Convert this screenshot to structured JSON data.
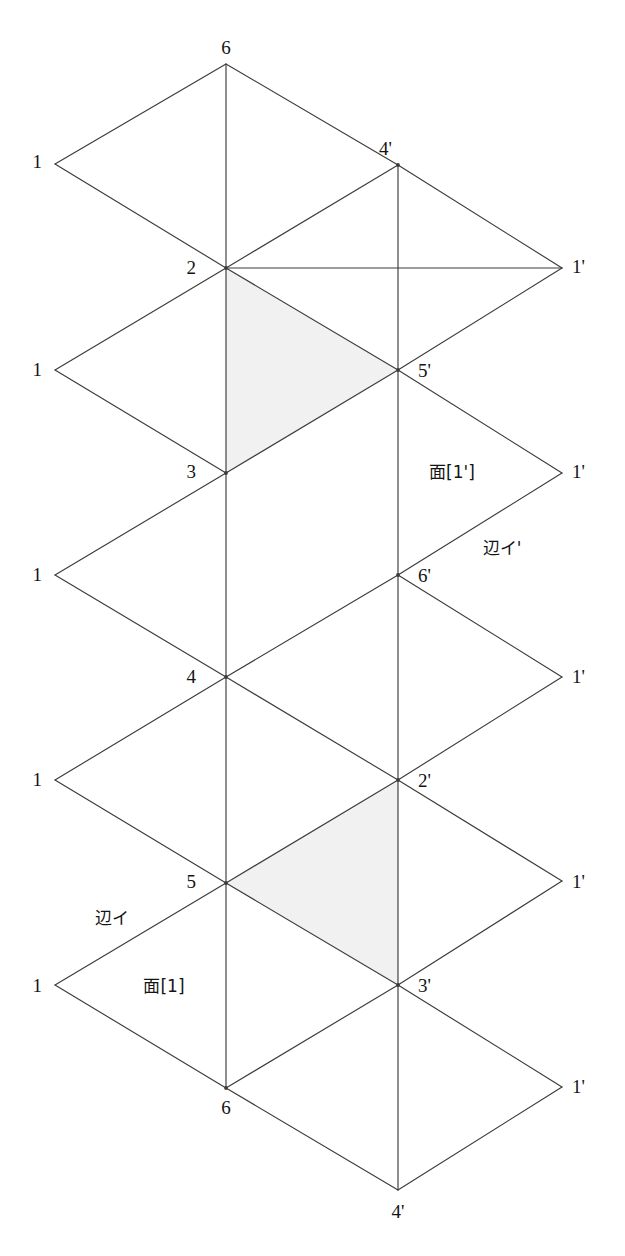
{
  "diagram": {
    "background_color": "#ffffff",
    "line_color": "#3c3c3c",
    "shade_color": "#f1f1f1",
    "vertex_labels": [
      {
        "id": "v-6-top",
        "text": "6",
        "x": 226,
        "y": 47,
        "anchor": "c"
      },
      {
        "id": "v-1-a",
        "text": "1",
        "x": 42,
        "y": 161,
        "anchor": "r"
      },
      {
        "id": "v-4p-top",
        "text": "4'",
        "x": 392,
        "y": 148,
        "anchor": "r"
      },
      {
        "id": "v-2",
        "text": "2",
        "x": 196,
        "y": 267,
        "anchor": "r"
      },
      {
        "id": "v-1p-a",
        "text": "1'",
        "x": 572,
        "y": 266,
        "anchor": "l"
      },
      {
        "id": "v-1-b",
        "text": "1",
        "x": 42,
        "y": 369,
        "anchor": "r"
      },
      {
        "id": "v-5p",
        "text": "5'",
        "x": 418,
        "y": 370,
        "anchor": "l"
      },
      {
        "id": "v-3",
        "text": "3",
        "x": 196,
        "y": 471,
        "anchor": "r"
      },
      {
        "id": "v-1p-b",
        "text": "1'",
        "x": 572,
        "y": 471,
        "anchor": "l"
      },
      {
        "id": "v-1-c",
        "text": "1",
        "x": 42,
        "y": 574,
        "anchor": "r"
      },
      {
        "id": "v-6p",
        "text": "6'",
        "x": 418,
        "y": 575,
        "anchor": "l"
      },
      {
        "id": "v-4",
        "text": "4",
        "x": 196,
        "y": 676,
        "anchor": "r"
      },
      {
        "id": "v-1p-c",
        "text": "1'",
        "x": 572,
        "y": 676,
        "anchor": "l"
      },
      {
        "id": "v-1-d",
        "text": "1",
        "x": 42,
        "y": 779,
        "anchor": "r"
      },
      {
        "id": "v-2p",
        "text": "2'",
        "x": 418,
        "y": 780,
        "anchor": "l"
      },
      {
        "id": "v-5",
        "text": "5",
        "x": 196,
        "y": 881,
        "anchor": "r"
      },
      {
        "id": "v-1p-d",
        "text": "1'",
        "x": 572,
        "y": 881,
        "anchor": "l"
      },
      {
        "id": "v-1-e",
        "text": "1",
        "x": 42,
        "y": 985,
        "anchor": "r"
      },
      {
        "id": "v-3p",
        "text": "3'",
        "x": 418,
        "y": 985,
        "anchor": "l"
      },
      {
        "id": "v-6-bottom",
        "text": "6",
        "x": 226,
        "y": 1107,
        "anchor": "c"
      },
      {
        "id": "v-1p-e",
        "text": "1'",
        "x": 572,
        "y": 1086,
        "anchor": "l"
      },
      {
        "id": "v-4p-bot",
        "text": "4'",
        "x": 398,
        "y": 1211,
        "anchor": "c"
      }
    ],
    "annotation_labels": [
      {
        "id": "face-1-prime",
        "text": "面[1']",
        "x": 452,
        "y": 472
      },
      {
        "id": "edge-i-prime",
        "text": "辺イ'",
        "x": 502,
        "y": 548
      },
      {
        "id": "edge-i",
        "text": "辺イ",
        "x": 112,
        "y": 918
      },
      {
        "id": "face-1",
        "text": "面[1]",
        "x": 164,
        "y": 986
      }
    ],
    "geometry": {
      "columns_x": [
        55,
        226,
        398,
        562
      ],
      "row_pitch_y": 102.4,
      "top_vertex_y": 64,
      "bottom_vertex_y": 1190
    },
    "shaded_regions": [
      {
        "id": "shade-upper",
        "points": "226,268 398,370 226,473"
      },
      {
        "id": "shade-lower",
        "points": "226,883 398,780 398,985"
      }
    ],
    "edges": [
      "55,164 226,64",
      "226,64 398,165",
      "398,165 562,268",
      "55,164 226,268",
      "226,268 398,165",
      "226,268 562,268",
      "226,64 226,268",
      "398,165 398,370",
      "55,370 226,268",
      "226,268 398,370",
      "398,370 562,268",
      "55,370 226,473",
      "226,473 398,370",
      "398,370 562,473",
      "226,268 226,473",
      "55,575 226,473",
      "226,473 398,370",
      "398,370 398,575",
      "55,575 226,677",
      "226,677 398,575",
      "398,575 562,473",
      "398,575 562,677",
      "226,473 226,677",
      "55,780 226,677",
      "226,677 398,780",
      "398,780 562,677",
      "398,575 398,780",
      "55,780 226,883",
      "226,883 398,780",
      "398,780 562,881",
      "226,677 226,883",
      "55,985 226,883",
      "226,883 398,985",
      "398,985 562,881",
      "398,780 398,985",
      "55,985 226,1088",
      "226,1088 398,985",
      "398,985 562,1087",
      "226,883 226,1088",
      "226,1088 398,1190",
      "398,1190 562,1087",
      "398,985 398,1190"
    ]
  }
}
